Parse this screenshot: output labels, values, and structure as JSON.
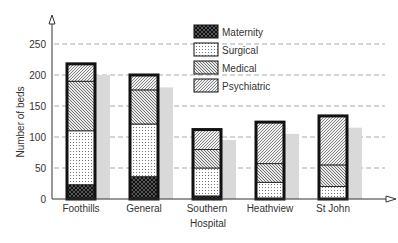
{
  "chart_data": {
    "type": "bar",
    "stacked": true,
    "title": "",
    "xlabel": "Hospital",
    "ylabel": "Number of beds",
    "ylim": [
      0,
      280
    ],
    "yticks": [
      0,
      50,
      100,
      150,
      200,
      250
    ],
    "grid": "dashed horizontal",
    "legend_position": "top-center",
    "categories": [
      "Foothills",
      "General",
      "Southern",
      "Heathview",
      "St John"
    ],
    "series": [
      {
        "name": "Maternity",
        "pattern": "crosshatch",
        "values": [
          23,
          36,
          5,
          0,
          0
        ]
      },
      {
        "name": "Surgical",
        "pattern": "dots",
        "values": [
          87,
          85,
          45,
          27,
          20
        ]
      },
      {
        "name": "Medical",
        "pattern": "diagonal-back",
        "values": [
          80,
          55,
          30,
          30,
          35
        ]
      },
      {
        "name": "Psychiatric",
        "pattern": "diagonal-forward",
        "values": [
          28,
          24,
          32,
          67,
          79
        ]
      }
    ],
    "totals": [
      218,
      200,
      112,
      124,
      134
    ],
    "comparison_series": {
      "name": "",
      "color": "#d9d9d9",
      "values": [
        200,
        180,
        95,
        105,
        115
      ]
    }
  }
}
